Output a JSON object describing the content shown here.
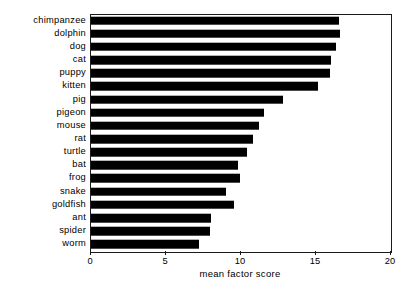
{
  "chart_data": {
    "type": "bar",
    "orientation": "horizontal",
    "title": "",
    "xlabel": "mean factor score",
    "ylabel": "",
    "xlim": [
      0,
      20
    ],
    "ylim": null,
    "xticks": [
      0,
      5,
      10,
      15,
      20
    ],
    "xtick_labels": [
      "0",
      "5",
      "10",
      "15",
      "20"
    ],
    "grid": false,
    "legend": null,
    "bar_color": "#000000",
    "frame_color": "#1a1a1a",
    "categories": [
      "chimpanzee",
      "dolphin",
      "dog",
      "cat",
      "puppy",
      "kitten",
      "pig",
      "pigeon",
      "mouse",
      "rat",
      "turtle",
      "bat",
      "frog",
      "snake",
      "goldfish",
      "ant",
      "spider",
      "worm"
    ],
    "values": [
      16.5,
      16.6,
      16.3,
      16.0,
      15.9,
      15.1,
      12.8,
      11.5,
      11.2,
      10.8,
      10.4,
      9.8,
      9.9,
      9.0,
      9.5,
      8.0,
      7.9,
      7.2
    ]
  }
}
